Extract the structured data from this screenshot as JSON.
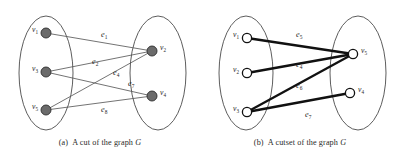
{
  "figure": {
    "panels": [
      {
        "id": "a",
        "caption_tag": "(a)",
        "caption_text_before": "A cut of the graph",
        "caption_graph_name": "G",
        "left_group": {
          "vertices": [
            {
              "name": "v1",
              "label": "v",
              "sub": "1",
              "cx": 46,
              "cy": 33,
              "r": 5.0
            },
            {
              "name": "v3",
              "label": "v",
              "sub": "3",
              "cx": 46,
              "cy": 72,
              "r": 5.0
            },
            {
              "name": "v5",
              "label": "v",
              "sub": "5",
              "cx": 46,
              "cy": 110,
              "r": 5.0
            }
          ],
          "ellipse": {
            "cx": 46,
            "cy": 73,
            "rx": 27,
            "ry": 57
          }
        },
        "right_group": {
          "vertices": [
            {
              "name": "v2",
              "label": "v",
              "sub": "2",
              "cx": 152,
              "cy": 51,
              "r": 5.0
            },
            {
              "name": "v4",
              "label": "v",
              "sub": "4",
              "cx": 152,
              "cy": 96,
              "r": 5.0
            }
          ],
          "ellipse": {
            "cx": 158,
            "cy": 73,
            "rx": 28,
            "ry": 57
          }
        },
        "edges": [
          {
            "name": "e1",
            "label": "e",
            "sub": "1",
            "from": "v1",
            "to": "v2",
            "lx": 101,
            "ly": 37
          },
          {
            "name": "e2",
            "label": "e",
            "sub": "2",
            "from": "v3",
            "to": "v2",
            "lx": 92,
            "ly": 64
          },
          {
            "name": "e4",
            "label": "e",
            "sub": "4",
            "from": "v5",
            "to": "v2",
            "lx": 113,
            "ly": 75
          },
          {
            "name": "e7",
            "label": "e",
            "sub": "7",
            "from": "v3",
            "to": "v4",
            "lx": 128,
            "ly": 86
          },
          {
            "name": "e8",
            "label": "e",
            "sub": "8",
            "from": "v5",
            "to": "v4",
            "lx": 101,
            "ly": 112
          }
        ]
      },
      {
        "id": "b",
        "caption_tag": "(b)",
        "caption_text_before": "A cutset of the graph",
        "caption_graph_name": "G",
        "left_group": {
          "vertices": [
            {
              "name": "v1",
              "label": "v",
              "sub": "1",
              "cx": 47,
              "cy": 38,
              "r": 4.6
            },
            {
              "name": "v2",
              "label": "v",
              "sub": "2",
              "cx": 47,
              "cy": 73,
              "r": 4.6
            },
            {
              "name": "v3",
              "label": "v",
              "sub": "3",
              "cx": 47,
              "cy": 112,
              "r": 4.6
            }
          ],
          "ellipse": {
            "cx": 46,
            "cy": 73,
            "rx": 27,
            "ry": 57
          }
        },
        "right_group": {
          "vertices": [
            {
              "name": "v5",
              "label": "v",
              "sub": "5",
              "cx": 153,
              "cy": 54,
              "r": 4.6
            },
            {
              "name": "v4",
              "label": "v",
              "sub": "4",
              "cx": 150,
              "cy": 93,
              "r": 4.6
            }
          ],
          "ellipse": {
            "cx": 158,
            "cy": 73,
            "rx": 28,
            "ry": 57
          }
        },
        "edges": [
          {
            "name": "e5",
            "label": "e",
            "sub": "5",
            "from": "v1",
            "to": "v5",
            "lx": 96,
            "ly": 37
          },
          {
            "name": "e4",
            "label": "e",
            "sub": "4",
            "from": "v2",
            "to": "v5",
            "lx": 96,
            "ly": 67
          },
          {
            "name": "e6",
            "label": "e",
            "sub": "6",
            "from": "v3",
            "to": "v5",
            "lx": 96,
            "ly": 88
          },
          {
            "name": "e7",
            "label": "e",
            "sub": "7",
            "from": "v3",
            "to": "v4",
            "lx": 105,
            "ly": 117
          }
        ]
      }
    ]
  }
}
